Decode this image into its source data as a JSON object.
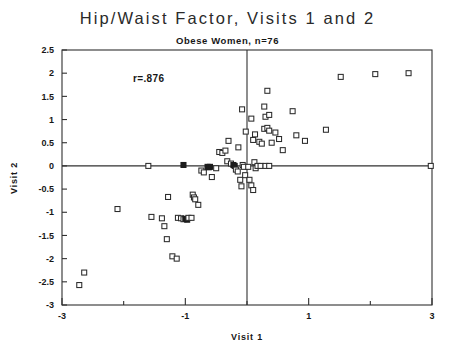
{
  "chart_data": {
    "type": "scatter",
    "title": "Hip/Waist Factor, Visits 1 and 2",
    "subtitle": "Obese Women, n=76",
    "xlabel": "Visit 1",
    "ylabel": "Visit 2",
    "xlim": [
      -3,
      3
    ],
    "ylim": [
      -3,
      2.5
    ],
    "grid": false,
    "legend": null,
    "annotations": [
      {
        "text": "r=.876",
        "x": -1.85,
        "y": 1.82
      }
    ],
    "xticks": [
      -3,
      -2,
      -1,
      0,
      1,
      2,
      3
    ],
    "xtick_labels": [
      "-3",
      "",
      "-1",
      "",
      "1",
      "",
      "3"
    ],
    "yticks": [
      2.5,
      2,
      1.5,
      1,
      0.5,
      0,
      -0.5,
      -1,
      -1.5,
      -2,
      -2.5,
      -3
    ],
    "ytick_labels": [
      "2.5",
      "2",
      "1.5",
      "1",
      "0.5",
      "0",
      "-0.5",
      "-1",
      "-1.5",
      "-2",
      "-2.5",
      "-3"
    ],
    "marker": "open-square",
    "marker_size": 5,
    "zero_lines": {
      "x": 0,
      "y": 0
    },
    "points": [
      {
        "x": -2.72,
        "y": -2.57,
        "filled": false
      },
      {
        "x": -2.64,
        "y": -2.3,
        "filled": false
      },
      {
        "x": -2.1,
        "y": -0.93,
        "filled": false
      },
      {
        "x": -1.55,
        "y": -1.1,
        "filled": false
      },
      {
        "x": -1.38,
        "y": -1.13,
        "filled": false
      },
      {
        "x": -1.34,
        "y": -1.3,
        "filled": false
      },
      {
        "x": -1.3,
        "y": -1.58,
        "filled": false
      },
      {
        "x": -1.28,
        "y": -0.67,
        "filled": false
      },
      {
        "x": -1.21,
        "y": -1.95,
        "filled": false
      },
      {
        "x": -1.14,
        "y": -2.0,
        "filled": false
      },
      {
        "x": -1.12,
        "y": -1.12,
        "filled": false
      },
      {
        "x": -1.07,
        "y": -1.13,
        "filled": false
      },
      {
        "x": -1.03,
        "y": -1.15,
        "filled": false
      },
      {
        "x": -1.0,
        "y": -1.14,
        "filled": true
      },
      {
        "x": -0.97,
        "y": -1.16,
        "filled": true
      },
      {
        "x": -0.95,
        "y": -1.12,
        "filled": false
      },
      {
        "x": -0.9,
        "y": -1.12,
        "filled": false
      },
      {
        "x": -0.88,
        "y": -0.62,
        "filled": false
      },
      {
        "x": -0.86,
        "y": -0.68,
        "filled": false
      },
      {
        "x": -0.84,
        "y": -0.72,
        "filled": false
      },
      {
        "x": -0.79,
        "y": -0.84,
        "filled": false
      },
      {
        "x": -0.74,
        "y": -0.1,
        "filled": false
      },
      {
        "x": -0.7,
        "y": -0.14,
        "filled": false
      },
      {
        "x": -0.64,
        "y": -0.02,
        "filled": true
      },
      {
        "x": -0.62,
        "y": -0.03,
        "filled": true
      },
      {
        "x": -0.6,
        "y": -0.02,
        "filled": true
      },
      {
        "x": -0.57,
        "y": -0.24,
        "filled": false
      },
      {
        "x": -0.5,
        "y": -0.05,
        "filled": false
      },
      {
        "x": -1.6,
        "y": 0.0,
        "filled": false
      },
      {
        "x": -1.03,
        "y": 0.02,
        "filled": true
      },
      {
        "x": -0.45,
        "y": 0.3,
        "filled": false
      },
      {
        "x": -0.4,
        "y": 0.28,
        "filled": false
      },
      {
        "x": -0.35,
        "y": 0.33,
        "filled": false
      },
      {
        "x": -0.32,
        "y": 0.1,
        "filled": false
      },
      {
        "x": -0.3,
        "y": 0.54,
        "filled": false
      },
      {
        "x": -0.26,
        "y": 0.05,
        "filled": false
      },
      {
        "x": -0.22,
        "y": 0.02,
        "filled": true
      },
      {
        "x": -0.2,
        "y": 0.0,
        "filled": true
      },
      {
        "x": -0.18,
        "y": -0.08,
        "filled": false
      },
      {
        "x": -0.15,
        "y": -0.12,
        "filled": false
      },
      {
        "x": -0.14,
        "y": 0.4,
        "filled": false
      },
      {
        "x": -0.11,
        "y": -0.3,
        "filled": false
      },
      {
        "x": -0.09,
        "y": -0.44,
        "filled": false
      },
      {
        "x": -0.07,
        "y": 0.02,
        "filled": false
      },
      {
        "x": -0.05,
        "y": -0.02,
        "filled": false
      },
      {
        "x": -0.03,
        "y": -0.2,
        "filled": false
      },
      {
        "x": 0.02,
        "y": -0.02,
        "filled": false
      },
      {
        "x": 0.04,
        "y": -0.3,
        "filled": false
      },
      {
        "x": 0.07,
        "y": -0.42,
        "filled": false
      },
      {
        "x": 0.1,
        "y": -0.52,
        "filled": false
      },
      {
        "x": 0.12,
        "y": 0.08,
        "filled": false
      },
      {
        "x": 0.14,
        "y": -0.05,
        "filled": false
      },
      {
        "x": 0.17,
        "y": 0.0,
        "filled": false
      },
      {
        "x": 0.22,
        "y": 0.0,
        "filled": false
      },
      {
        "x": 0.3,
        "y": 0.0,
        "filled": false
      },
      {
        "x": 0.36,
        "y": 0.0,
        "filled": false
      },
      {
        "x": 0.1,
        "y": 0.56,
        "filled": false
      },
      {
        "x": 0.13,
        "y": 0.68,
        "filled": false
      },
      {
        "x": 0.2,
        "y": 0.52,
        "filled": false
      },
      {
        "x": 0.24,
        "y": 0.48,
        "filled": false
      },
      {
        "x": 0.28,
        "y": 0.8,
        "filled": false
      },
      {
        "x": 0.33,
        "y": 0.82,
        "filled": false
      },
      {
        "x": 0.36,
        "y": 0.76,
        "filled": false
      },
      {
        "x": 0.4,
        "y": 0.5,
        "filled": false
      },
      {
        "x": 0.46,
        "y": 0.72,
        "filled": false
      },
      {
        "x": 0.52,
        "y": 0.58,
        "filled": false
      },
      {
        "x": 0.58,
        "y": 0.34,
        "filled": false
      },
      {
        "x": 0.28,
        "y": 1.28,
        "filled": false
      },
      {
        "x": 0.3,
        "y": 1.06,
        "filled": false
      },
      {
        "x": 0.36,
        "y": 1.1,
        "filled": false
      },
      {
        "x": 0.07,
        "y": 1.02,
        "filled": false
      },
      {
        "x": -0.08,
        "y": 1.22,
        "filled": false
      },
      {
        "x": -0.02,
        "y": 0.74,
        "filled": false
      },
      {
        "x": 0.33,
        "y": 1.62,
        "filled": false
      },
      {
        "x": 0.74,
        "y": 1.18,
        "filled": false
      },
      {
        "x": 0.8,
        "y": 0.66,
        "filled": false
      },
      {
        "x": 0.94,
        "y": 0.54,
        "filled": false
      },
      {
        "x": 1.28,
        "y": 0.78,
        "filled": false
      },
      {
        "x": 1.52,
        "y": 1.92,
        "filled": false
      },
      {
        "x": 2.08,
        "y": 1.98,
        "filled": false
      },
      {
        "x": 2.62,
        "y": 2.0,
        "filled": false
      },
      {
        "x": 2.98,
        "y": 0.0,
        "filled": false
      }
    ]
  },
  "axes": {
    "x_axis_label": "Visit 1",
    "y_axis_label": "Visit 2"
  }
}
